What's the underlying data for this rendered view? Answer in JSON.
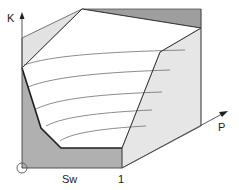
{
  "diagram": {
    "type": "3d-surface-schematic",
    "axes": {
      "vertical": {
        "label": "K"
      },
      "depth": {
        "label": "P"
      },
      "horizontal": {
        "ticks": [
          {
            "label": "Sw"
          },
          {
            "label": "1"
          }
        ]
      }
    },
    "origin_marker": "circle",
    "colors": {
      "background": "#ffffff",
      "surface": "#ffffff",
      "light_panel": "#e6e6e6",
      "dark_panel": "#a9a9a9",
      "line": "#2a2a2a",
      "contour": "#7a7a7a"
    },
    "contour_count": 5
  }
}
